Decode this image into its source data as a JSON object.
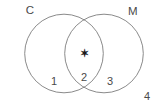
{
  "figure": {
    "kind": "venn-diagram",
    "width": 161,
    "height": 108,
    "background_color": "#ffffff",
    "stroke_color": "#7d7d7d",
    "stroke_width": 0.9,
    "text_color": "#4a4a4a",
    "marker_color": "#1a1a1a"
  },
  "sets": [
    {
      "id": "left",
      "label": "C",
      "label_x": 30,
      "label_y": 11,
      "cx": 64,
      "cy": 53.5,
      "r": 39.3
    },
    {
      "id": "right",
      "label": "M",
      "label_x": 133,
      "label_y": 12,
      "cx": 104,
      "cy": 53.5,
      "r": 39.3
    }
  ],
  "regions": [
    {
      "id": "c-only",
      "label": "1",
      "x": 54,
      "y": 81
    },
    {
      "id": "intersection",
      "label": "2",
      "x": 84,
      "y": 77
    },
    {
      "id": "m-only",
      "label": "3",
      "x": 110,
      "y": 81
    },
    {
      "id": "outside",
      "label": "4",
      "x": 147,
      "y": 96
    }
  ],
  "markers": [
    {
      "id": "intersection-star",
      "glyph": "✶",
      "x": 84,
      "y": 53,
      "region": "intersection"
    }
  ]
}
